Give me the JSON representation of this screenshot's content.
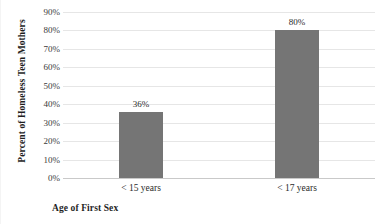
{
  "chart_data": {
    "type": "bar",
    "title": "",
    "categories": [
      "< 15 years",
      "< 17 years"
    ],
    "values": [
      36,
      80
    ],
    "value_labels": [
      "36%",
      "80%"
    ],
    "xlabel": "Age of First Sex",
    "ylabel": "Percent of Homeless Teen Mothers",
    "ylim": [
      0,
      90
    ],
    "ytick_values": [
      90,
      80,
      70,
      60,
      50,
      40,
      30,
      20,
      10,
      0
    ],
    "ytick_labels": [
      "90%",
      "80%",
      "70%",
      "60%",
      "50%",
      "40%",
      "30%",
      "20%",
      "10%",
      "0%"
    ],
    "grid": true,
    "legend": false,
    "bar_color": "#757575",
    "gridline_color": "#e6e6e6",
    "axis_color": "#c9c9c9"
  }
}
